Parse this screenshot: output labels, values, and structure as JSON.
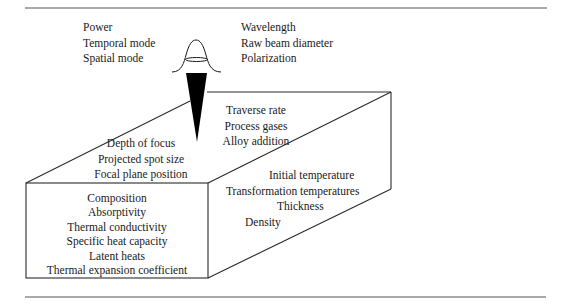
{
  "diagram": {
    "type": "laser process parameters schematic",
    "laser_beam_parameters_left": [
      "Power",
      "Temporal mode",
      "Spatial mode"
    ],
    "laser_beam_parameters_right": [
      "Wavelength",
      "Raw beam diameter",
      "Polarization"
    ],
    "process_parameters": [
      "Traverse rate",
      "Process gases",
      "Alloy addition"
    ],
    "focusing_parameters": [
      "Depth of focus",
      "Projected spot size",
      "Focal plane position"
    ],
    "material_properties_front": [
      "Composition",
      "Absorptivity",
      "Thermal conductivity",
      "Specific heat capacity",
      "Latent heats",
      "Thermal expansion coefficient"
    ],
    "material_properties_side": [
      "Initial temperature",
      "Transformation temperatures",
      "Thickness",
      "Density"
    ]
  },
  "colors": {
    "line": "#2a2a2a",
    "beam": "#000000",
    "text": "#1a1a1a"
  }
}
